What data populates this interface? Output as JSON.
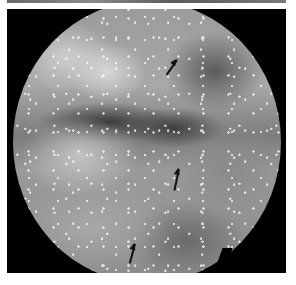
{
  "image": {
    "description": "Grayscale circular endoscopic view of mucosal tissue surface with three black arrows marking features",
    "arrows": [
      {
        "x": 176,
        "y": 60,
        "direction": "up-right"
      },
      {
        "x": 178,
        "y": 170,
        "direction": "up"
      },
      {
        "x": 133,
        "y": 244,
        "direction": "up"
      }
    ]
  }
}
